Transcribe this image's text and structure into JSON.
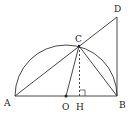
{
  "diagram": {
    "type": "geometry",
    "colors": {
      "stroke": "#333333",
      "background": "#ffffff"
    },
    "points": {
      "A": {
        "label": "A",
        "x": 15,
        "y": 96
      },
      "O": {
        "label": "O",
        "x": 66,
        "y": 96
      },
      "H": {
        "label": "H",
        "x": 80,
        "y": 96
      },
      "B": {
        "label": "B",
        "x": 117,
        "y": 96
      },
      "C": {
        "label": "C",
        "x": 79,
        "y": 46
      },
      "D": {
        "label": "D",
        "x": 117,
        "y": 17
      }
    },
    "segments": [
      {
        "from": "A",
        "to": "B",
        "style": "solid"
      },
      {
        "from": "A",
        "to": "D",
        "style": "solid"
      },
      {
        "from": "B",
        "to": "D",
        "style": "solid"
      },
      {
        "from": "O",
        "to": "C",
        "style": "solid"
      },
      {
        "from": "C",
        "to": "B",
        "style": "solid"
      },
      {
        "from": "C",
        "to": "H",
        "style": "dashed"
      }
    ],
    "arc": {
      "center": "O",
      "radius": 51,
      "type": "upper-semicircle"
    },
    "right_angle_mark": {
      "at": "H"
    }
  }
}
